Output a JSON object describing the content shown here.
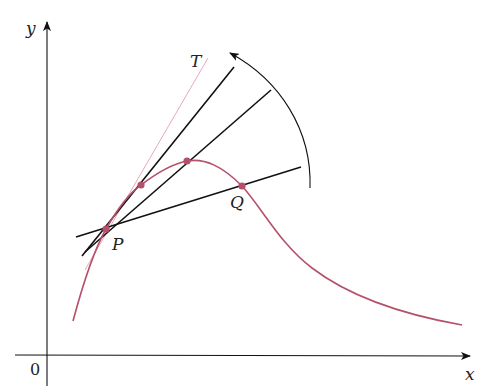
{
  "diagram": {
    "type": "secant-lines-approaching-tangent",
    "axes": {
      "x_label": "x",
      "y_label": "y",
      "origin_label": "0"
    },
    "labels": {
      "tangent": "T",
      "point_p": "P",
      "point_q": "Q"
    },
    "colors": {
      "curve": "#b5506a",
      "tangent": "#e8a8b8",
      "lines": "#111111",
      "points": "#b5506a",
      "axes": "#111111"
    },
    "points": [
      {
        "name": "P",
        "x": 106,
        "y": 229
      },
      {
        "name": "Q2",
        "x": 141,
        "y": 185
      },
      {
        "name": "Q1",
        "x": 187,
        "y": 161
      },
      {
        "name": "Q",
        "x": 242,
        "y": 186
      }
    ],
    "lines": [
      {
        "name": "tangent-T",
        "x1": 85,
        "y1": 270,
        "x2": 208,
        "y2": 58
      },
      {
        "name": "secant-PQ2",
        "x1": 82,
        "y1": 256,
        "x2": 234,
        "y2": 67
      },
      {
        "name": "secant-PQ1",
        "x1": 85,
        "y1": 252,
        "x2": 271,
        "y2": 90
      },
      {
        "name": "secant-PQ",
        "x1": 76,
        "y1": 237,
        "x2": 301,
        "y2": 167
      }
    ]
  }
}
